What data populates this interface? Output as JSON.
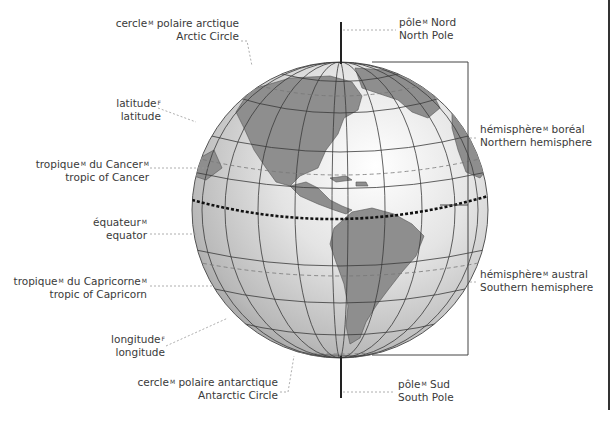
{
  "diagram": {
    "colors": {
      "ocean": "#e9e9e9",
      "ocean_shade": "#a8a8a8",
      "land": "#8f8f8f",
      "grid": "#3a3a3a",
      "leader": "#999999",
      "text": "#3a3a3a"
    },
    "labels": {
      "arctic_circle": {
        "fr": "cercle",
        "fr_gender": "M",
        "fr_rest": " polaire arctique",
        "en": "Arctic Circle"
      },
      "latitude": {
        "fr": "latitude",
        "fr_gender": "F",
        "en": "latitude"
      },
      "tropic_cancer": {
        "fr": "tropique",
        "fr_gender": "M",
        "fr_mid": " du Cancer",
        "fr_gender2": "M",
        "en": "tropic of Cancer"
      },
      "equator": {
        "fr": "équateur",
        "fr_gender": "M",
        "en": "equator"
      },
      "tropic_capricorn": {
        "fr": "tropique",
        "fr_gender": "M",
        "fr_mid": " du Capricorne",
        "fr_gender2": "M",
        "en": "tropic of Capricorn"
      },
      "longitude": {
        "fr": "longitude",
        "fr_gender": "F",
        "en": "longitude"
      },
      "antarctic_circle": {
        "fr": "cercle",
        "fr_gender": "M",
        "fr_rest": " polaire antarctique",
        "en": "Antarctic Circle"
      },
      "north_pole": {
        "fr": "pôle",
        "fr_gender": "M",
        "fr_rest": " Nord",
        "en": "North Pole"
      },
      "south_pole": {
        "fr": "pôle",
        "fr_gender": "M",
        "fr_rest": " Sud",
        "en": "South Pole"
      },
      "northern_hemisphere": {
        "fr": "hémisphère",
        "fr_gender": "M",
        "fr_rest": " boréal",
        "en": "Northern hemisphere"
      },
      "southern_hemisphere": {
        "fr": "hémisphère",
        "fr_gender": "M",
        "fr_rest": " austral",
        "en": "Southern hemisphere"
      }
    }
  }
}
